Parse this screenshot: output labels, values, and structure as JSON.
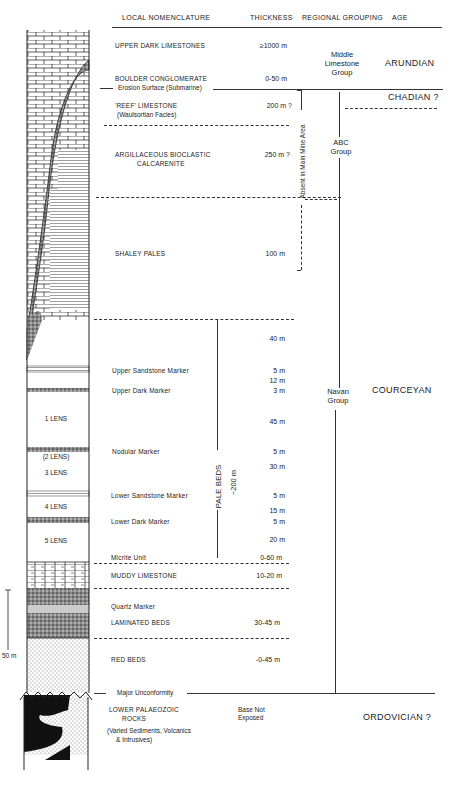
{
  "headers": {
    "nomenclature": "LOCAL  NOMENCLATURE",
    "thickness": "THICKNESS",
    "regional": "REGIONAL  GROUPING",
    "age": "AGE"
  },
  "units": [
    {
      "name": "UPPER  DARK  LIMESTONES",
      "thickness": "≥1000 m"
    },
    {
      "name": "BOULDER  CONGLOMERATE",
      "thickness": "0-50 m"
    },
    {
      "name": "Erosion  Surface  (Submarine)"
    },
    {
      "name": "'REEF'  LIMESTONE",
      "sub": "(Waulsortian  Facies)",
      "thickness": "200 m ?"
    },
    {
      "name": "ARGILLACEOUS  BIOCLASTIC",
      "sub": "CALCARENITE",
      "thickness": "250 m ?"
    },
    {
      "name": "SHALEY  PALES",
      "thickness": "100  m"
    },
    {
      "name": "",
      "thickness": "40  m"
    },
    {
      "name": "Upper  Sandstone  Marker",
      "thickness": "5  m"
    },
    {
      "name": "",
      "thickness": "12  m"
    },
    {
      "name": "Upper  Dark  Marker",
      "thickness": "3  m"
    },
    {
      "name": "",
      "thickness": "45  m"
    },
    {
      "name": "Nodular  Marker",
      "thickness": "5  m"
    },
    {
      "name": "",
      "thickness": "30  m"
    },
    {
      "name": "Lower  Sandstone  Marker",
      "thickness": "5  m"
    },
    {
      "name": "",
      "thickness": "15  m"
    },
    {
      "name": "Lower  Dark  Marker",
      "thickness": "5  m"
    },
    {
      "name": "",
      "thickness": "20  m"
    },
    {
      "name": "Micrite  Unit",
      "thickness": "0-60  m"
    },
    {
      "name": "MUDDY  LIMESTONE",
      "thickness": "10-20  m"
    },
    {
      "name": "Quartz  Marker"
    },
    {
      "name": "LAMINATED  BEDS",
      "thickness": "30-45  m"
    },
    {
      "name": "RED  BEDS",
      "thickness": "-0-45  m"
    },
    {
      "name": "Major  Unconformity"
    },
    {
      "name": "LOWER  PALAEOZOIC",
      "sub": "ROCKS",
      "note1": "(Varied Sediments,  Volcanics",
      "note2": "& Intrusives)",
      "thickness1": "Base  Not",
      "thickness2": "Exposed"
    }
  ],
  "lenses": [
    "1  LENS",
    "(2  LENS)",
    "3  LENS",
    "4  LENS",
    "5  LENS"
  ],
  "groups": {
    "middle": [
      "Middle",
      "Limestone",
      "Group"
    ],
    "abc": [
      "ABC",
      "Group"
    ],
    "navan": [
      "Navan",
      "Group"
    ],
    "absent": "Absent  in  Main  Mine  Area",
    "pale_beds": "PALE   BEDS",
    "pale_thick": "~200  m"
  },
  "ages": {
    "arundian": "ARUNDIAN",
    "chadian": "CHADIAN  ?",
    "courceyan": "COURCEYAN",
    "ordovician": "ORDOVICIAN  ?"
  },
  "scale": {
    "label": "50 m"
  }
}
